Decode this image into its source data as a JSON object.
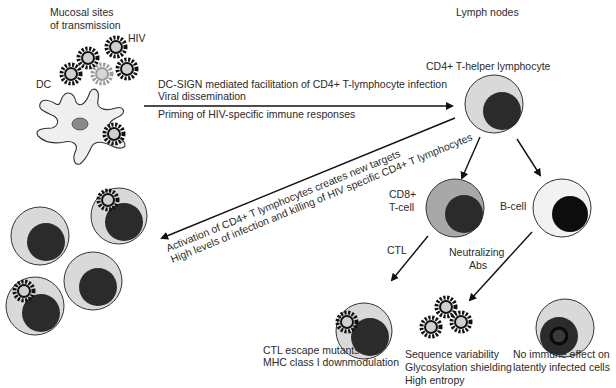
{
  "regions": {
    "mucosal": {
      "line1": "Mucosal sites",
      "line2": "of  transmission"
    },
    "lymph": "Lymph nodes"
  },
  "labels": {
    "hiv": "HIV",
    "dc": "DC",
    "cd4": "CD4+ T-helper lymphocyte",
    "cd8_line1": "CD8+",
    "cd8_line2": "T-cell",
    "bcell": "B-cell",
    "ctl": "CTL",
    "nab_line1": "Neutralizing",
    "nab_line2": "Abs"
  },
  "arrows": {
    "dc_to_cd4": {
      "above_line1": "DC-SIGN mediated facilitation of CD4+ T-lymphocyte infection",
      "above_line2": "Viral dissemination",
      "below": "Priming of HIV-specific immune responses"
    },
    "cd4_to_targets": {
      "line1": "Activation of CD4+ T lymphocytes creates new targets",
      "line2": "High levels of infection and killing of HIV specific CD4+ T lymphocytes"
    }
  },
  "outcomes": {
    "ctl_escape": {
      "line1": "CTL escape mutants",
      "line2": "MHC class I downmodulation"
    },
    "nab_escape": {
      "line1": "Sequence variability",
      "line2": "Glycosylation shielding",
      "line3": "High entropy"
    },
    "latent": {
      "line1": "No immune effect on",
      "line2": "latently infected cells"
    }
  },
  "colors": {
    "cytoplasm": "#d9d9d9",
    "nucleus": "#2b2b2b",
    "bcell_cytoplasm": "#f2f2f2",
    "bcell_nucleus": "#0d0d0d",
    "cd8_cytoplasm": "#a8a8a8",
    "dc_body": "#efefef",
    "dc_nucleus": "#8a8a8a",
    "virion_core": "#d0d0d0",
    "virion_spike": "#111111",
    "faded_virion": "#9a9a9a"
  }
}
